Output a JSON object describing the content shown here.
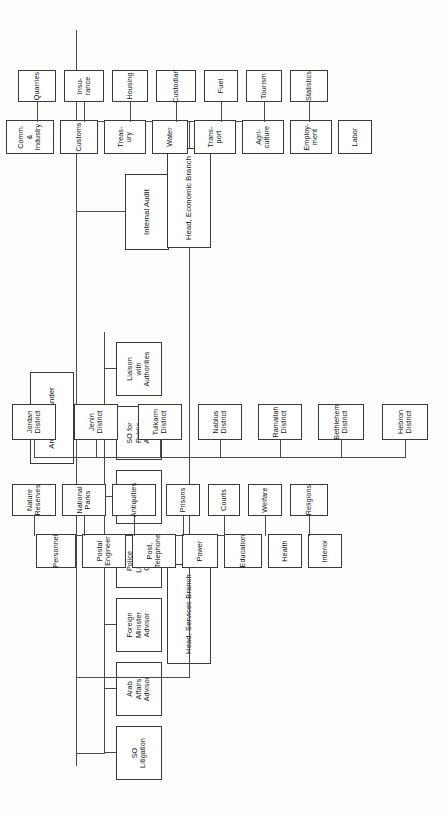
{
  "chart_data": {
    "type": "diagram",
    "orientation": "rotated-90-ccw",
    "nodes": {
      "root": "Area Commander",
      "internal_audit": "Internal Audit",
      "branch_services": "Head, Services Branch",
      "branch_economic": "Head, Economic Branch"
    },
    "staff": [
      "SO\nLitigation",
      "Arab\nAffairs\nAdvisor",
      "Foreign\nMinister\nAdvisor",
      "Police\nLiaison\nOffice",
      "Legal\nAdvisor",
      "SO for\nPublic\nAffairs",
      "Liaison\nwith\nAuthorities"
    ],
    "services_primary": [
      "Personnel",
      "Postal\nEngineer",
      "Post,\nTelephone",
      "Power",
      "Education",
      "Health",
      "Interior"
    ],
    "services_secondary": [
      "Nature\nReserves",
      "National\nParks",
      "Antiquities",
      "Prisons",
      "Courts",
      "Welfare",
      "Religions"
    ],
    "economic_primary": [
      "Comm.\n&\nIndustry",
      "Customs",
      "Treas-\nury",
      "Water",
      "Trans-\nport",
      "Agri-\nculture",
      "Employ-\nment",
      "Labor"
    ],
    "economic_secondary": [
      "Quarries",
      "Insu-\nrance",
      "Housing",
      "Custodian",
      "Fuel",
      "Tourism",
      "Statistics"
    ],
    "districts": [
      "Jordan\nDistrict",
      "Jenin\nDistrict",
      "Tulkarm\nDistrict",
      "Nablus\nDistrict",
      "Ramallah\nDistrict",
      "Bethlehem\nDistrict",
      "Hebron\nDistrict"
    ],
    "colors": {
      "page_background": "#fdfdfc",
      "box_fill": "#ffffff",
      "box_border": "#3a3a3a",
      "connector": "#4a4a4a",
      "text": "#111111"
    }
  }
}
